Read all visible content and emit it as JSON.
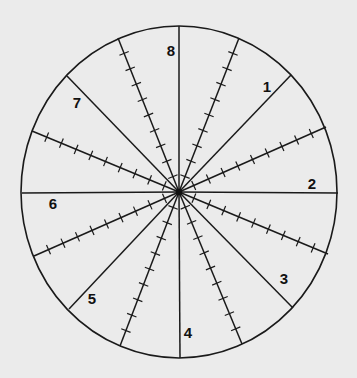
{
  "diagram": {
    "type": "dial-wheel",
    "background": "#ebebeb",
    "stroke": "#1a1a1a",
    "center": [
      179,
      192
    ],
    "ellipse": {
      "rx": 158,
      "ry": 166
    },
    "solid_lines": [
      {
        "name": "line-top",
        "end": [
          179,
          26
        ]
      },
      {
        "name": "line-bottom",
        "end": [
          180,
          358
        ]
      },
      {
        "name": "line-left",
        "end": [
          22,
          193
        ]
      },
      {
        "name": "line-right",
        "end": [
          338,
          193
        ]
      },
      {
        "name": "line-upper-right",
        "end": [
          291,
          75
        ]
      },
      {
        "name": "line-upper-left",
        "end": [
          67,
          76
        ]
      },
      {
        "name": "line-lower-right",
        "end": [
          293,
          308
        ]
      },
      {
        "name": "line-lower-left",
        "end": [
          69,
          309
        ]
      }
    ],
    "ticked_spokes": [
      {
        "name": "ticked-spoke-nnw",
        "end": [
          118,
          38
        ],
        "ticks": 9
      },
      {
        "name": "ticked-spoke-nne",
        "end": [
          239,
          38
        ],
        "ticks": 9
      },
      {
        "name": "ticked-spoke-ene",
        "end": [
          326,
          127
        ],
        "ticks": 9
      },
      {
        "name": "ticked-spoke-ese",
        "end": [
          328,
          254
        ],
        "ticks": 9
      },
      {
        "name": "ticked-spoke-sse",
        "end": [
          242,
          344
        ],
        "ticks": 9
      },
      {
        "name": "ticked-spoke-ssw",
        "end": [
          120,
          346
        ],
        "ticks": 9
      },
      {
        "name": "ticked-spoke-wsw",
        "end": [
          34,
          256
        ],
        "ticks": 9
      },
      {
        "name": "ticked-spoke-wnw",
        "end": [
          32,
          131
        ],
        "ticks": 9
      }
    ],
    "sector_labels": [
      {
        "text": "1",
        "pos": [
          267,
          92
        ]
      },
      {
        "text": "2",
        "pos": [
          312,
          189
        ]
      },
      {
        "text": "3",
        "pos": [
          284,
          284
        ]
      },
      {
        "text": "4",
        "pos": [
          188,
          338
        ]
      },
      {
        "text": "5",
        "pos": [
          92,
          304
        ]
      },
      {
        "text": "6",
        "pos": [
          53,
          209
        ]
      },
      {
        "text": "7",
        "pos": [
          77,
          108
        ]
      },
      {
        "text": "8",
        "pos": [
          171,
          56
        ]
      }
    ]
  }
}
